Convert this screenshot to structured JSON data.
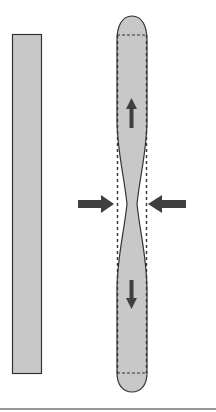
{
  "figure": {
    "colors": {
      "fill": "#c8c8c8",
      "outline": "#333333",
      "arrow": "#3f3f3f",
      "rule": "#9a9a9a",
      "background": "#ffffff"
    },
    "left_rod": {
      "label": "original-rod"
    },
    "right_rod": {
      "label": "deformed-rod"
    },
    "arrows": [
      {
        "name": "tension-arrow-up",
        "direction": "up"
      },
      {
        "name": "tension-arrow-down",
        "direction": "down"
      },
      {
        "name": "compression-arrow-left",
        "direction": "right"
      },
      {
        "name": "compression-arrow-right",
        "direction": "left"
      }
    ]
  }
}
